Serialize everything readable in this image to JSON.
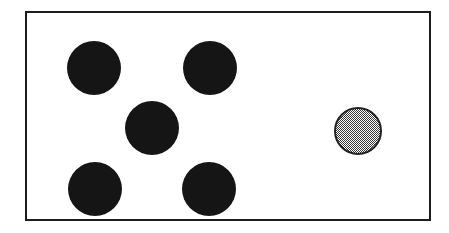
{
  "figure": {
    "title": "",
    "background_color": "#ffffff",
    "panel": {
      "fill_color": "#ffffff",
      "border_color": "#1d1d1d",
      "border_width_px": 2,
      "x": 25,
      "y": 11,
      "width": 406,
      "height": 210
    }
  },
  "chart_data": {
    "type": "scatter",
    "title": "",
    "xlabel": "",
    "ylabel": "",
    "xlim": [
      0,
      406
    ],
    "ylim": [
      0,
      210
    ],
    "grid": false,
    "legend": null,
    "counts": {
      "black_circles": 5,
      "gray_circles": 1,
      "total_circles": 6
    },
    "series": [
      {
        "name": "black-circles",
        "fill": "#151515",
        "outline": "none",
        "diameter_px": 54,
        "points": [
          {
            "id": "black-1",
            "cx": 69,
            "cy": 57,
            "r": 27
          },
          {
            "id": "black-2",
            "cx": 185,
            "cy": 57,
            "r": 27
          },
          {
            "id": "black-3",
            "cx": 127,
            "cy": 117,
            "r": 27
          },
          {
            "id": "black-4",
            "cx": 70,
            "cy": 178,
            "r": 27
          },
          {
            "id": "black-5",
            "cx": 184,
            "cy": 178,
            "r": 27
          }
        ]
      },
      {
        "name": "gray-circles",
        "fill": "#9a9a9a",
        "outline": "#222222",
        "diameter_px": 48,
        "points": [
          {
            "id": "gray-1",
            "cx": 333,
            "cy": 120,
            "r": 24
          }
        ]
      }
    ]
  }
}
